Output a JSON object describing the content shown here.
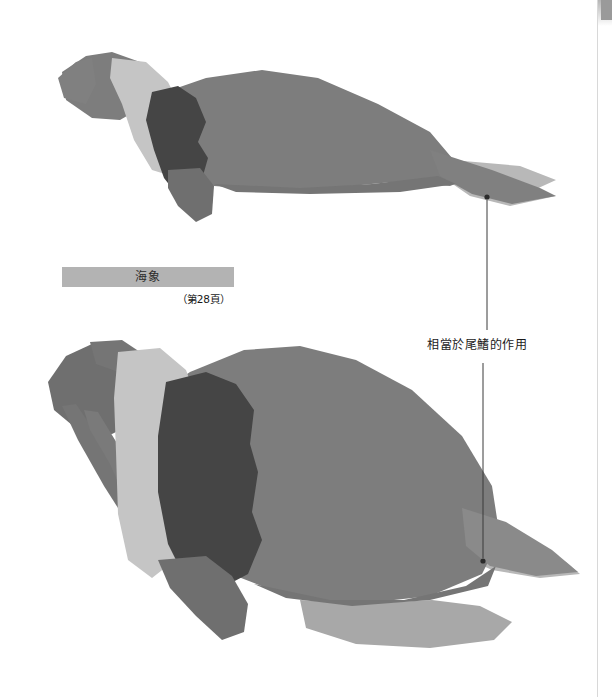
{
  "document": {
    "background_color": "#ffffff",
    "width": 612,
    "height": 697
  },
  "caption": {
    "title": "海象",
    "page_reference": "（第28頁）",
    "bar_color": "#b3b3b3",
    "text_color": "#2b2b2b"
  },
  "annotation": {
    "label": "相當於尾鰭的作用",
    "leader_color": "#3a3a3a",
    "dot_color": "#2b2b2b",
    "targets": [
      {
        "name": "upper-tail-flipper",
        "x": 487,
        "y": 196
      },
      {
        "name": "lower-tail-flipper",
        "x": 483,
        "y": 562
      }
    ]
  },
  "palette": {
    "body_mid_gray": "#7d7d7d",
    "shadow_dark_gray": "#454545",
    "highlight_light_gray": "#c5c5c5",
    "muted_gray": "#9a9a9a",
    "pale_gray": "#b8b8b8",
    "page_edge": "#d8d8d8"
  },
  "figures": [
    {
      "name": "walrus-swimming-upper",
      "description": "海象 side view, horizontal swimming posture",
      "parts": [
        "head",
        "neck-highlight",
        "shoulder-shadow",
        "body",
        "front-flipper",
        "rear-flipper",
        "tail-flipper"
      ]
    },
    {
      "name": "walrus-upright-lower",
      "description": "海象 side view, upright hauled-out posture with tusks",
      "parts": [
        "head",
        "tusks",
        "neck-highlight",
        "chest-shadow",
        "body",
        "front-flipper",
        "hind-flipper",
        "tail-flipper"
      ]
    }
  ]
}
